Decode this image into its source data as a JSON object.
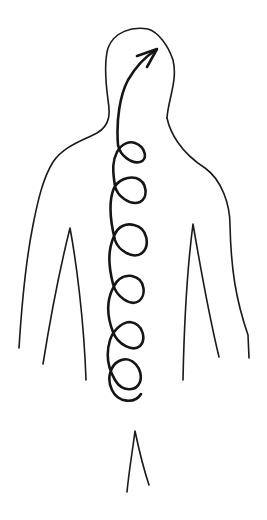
{
  "figure": {
    "title": "Body outline with spiral energy arrow rising along the spine",
    "background": "#ffffff",
    "ink_color": "#1a1a1a",
    "elements": [
      {
        "name": "body-outline",
        "description": "Hand-drawn human torso outline: head, shoulders, arms, legs"
      },
      {
        "name": "spiral-arrow",
        "description": "Looping spiral line rising up the spine with arrowhead in the head",
        "loops": 5
      }
    ]
  }
}
